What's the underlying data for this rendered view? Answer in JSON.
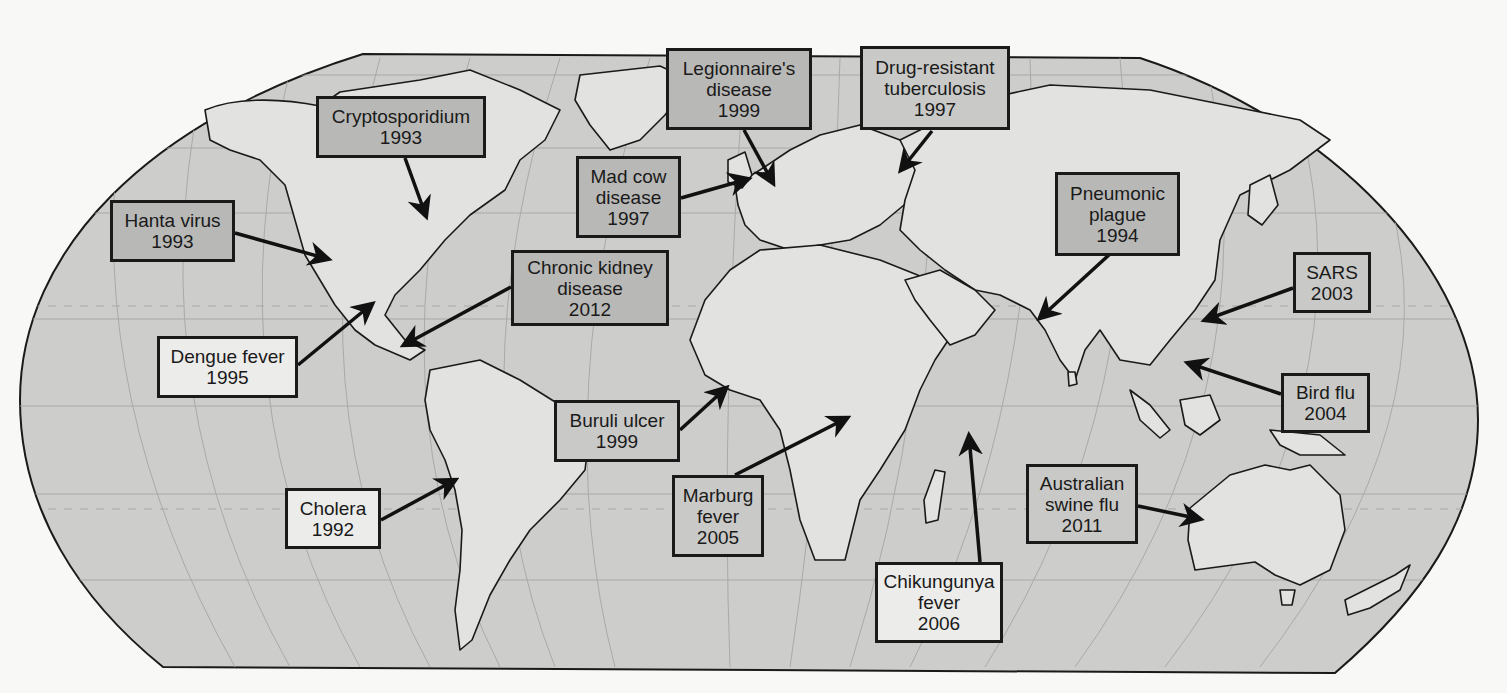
{
  "map": {
    "title": "Emerging and re-emerging infectious diseases",
    "projection": "Robinson-style world map with graticule",
    "colors": {
      "page_background": "#f8f8f7",
      "ocean": "#cdcdcb",
      "land": "#e2e2e0",
      "outline": "#1a1a1a",
      "graticule": "#a9a9a7",
      "label_dark": "#b8b8b6",
      "label_mid": "#c9c9c7",
      "label_light": "#ececea"
    }
  },
  "labels": [
    {
      "id": "cryptosporidium",
      "lines": [
        "Cryptosporidium",
        "1993"
      ],
      "tone": "dark",
      "box": [
        316,
        96,
        170,
        62
      ],
      "arrow": {
        "from": [
          405,
          158
        ],
        "to": [
          426,
          216
        ]
      }
    },
    {
      "id": "hanta-virus",
      "lines": [
        "Hanta virus",
        "1993"
      ],
      "tone": "dark",
      "box": [
        110,
        200,
        125,
        62
      ],
      "arrow": {
        "from": [
          235,
          233
        ],
        "to": [
          328,
          259
        ]
      }
    },
    {
      "id": "legionnaires",
      "lines": [
        "Legionnaire's",
        "disease",
        "1999"
      ],
      "tone": "dark",
      "box": [
        666,
        48,
        146,
        82
      ],
      "arrow": {
        "from": [
          744,
          130
        ],
        "to": [
          773,
          183
        ]
      }
    },
    {
      "id": "drug-resistant-tb",
      "lines": [
        "Drug-resistant",
        "tuberculosis",
        "1997"
      ],
      "tone": "mid",
      "box": [
        860,
        46,
        150,
        84
      ],
      "arrow": {
        "from": [
          932,
          131
        ],
        "to": [
          901,
          170
        ]
      }
    },
    {
      "id": "mad-cow",
      "lines": [
        "Mad cow",
        "disease",
        "1997"
      ],
      "tone": "dark",
      "box": [
        576,
        156,
        105,
        82
      ],
      "arrow": {
        "from": [
          681,
          198
        ],
        "to": [
          748,
          179
        ]
      }
    },
    {
      "id": "pneumonic-plague",
      "lines": [
        "Pneumonic",
        "plague",
        "1994"
      ],
      "tone": "dark",
      "box": [
        1055,
        172,
        125,
        84
      ],
      "arrow": {
        "from": [
          1110,
          254
        ],
        "to": [
          1040,
          318
        ]
      }
    },
    {
      "id": "sars",
      "lines": [
        "SARS",
        "2003"
      ],
      "tone": "mid",
      "box": [
        1293,
        252,
        78,
        61
      ],
      "arrow": {
        "from": [
          1293,
          288
        ],
        "to": [
          1205,
          320
        ]
      }
    },
    {
      "id": "chronic-kidney",
      "lines": [
        "Chronic kidney",
        "disease",
        "2012"
      ],
      "tone": "dark",
      "box": [
        511,
        250,
        158,
        76
      ],
      "arrow": {
        "from": [
          511,
          287
        ],
        "to": [
          404,
          345
        ]
      }
    },
    {
      "id": "dengue-fever",
      "lines": [
        "Dengue fever",
        "1995"
      ],
      "tone": "light",
      "box": [
        157,
        336,
        141,
        62
      ],
      "arrow": {
        "from": [
          298,
          365
        ],
        "to": [
          372,
          304
        ]
      }
    },
    {
      "id": "bird-flu",
      "lines": [
        "Bird flu",
        "2004"
      ],
      "tone": "mid",
      "box": [
        1281,
        373,
        89,
        60
      ],
      "arrow": {
        "from": [
          1281,
          394
        ],
        "to": [
          1188,
          363
        ]
      }
    },
    {
      "id": "buruli-ulcer",
      "lines": [
        "Buruli ulcer",
        "1999"
      ],
      "tone": "mid",
      "box": [
        554,
        400,
        126,
        62
      ],
      "arrow": {
        "from": [
          680,
          430
        ],
        "to": [
          726,
          388
        ]
      }
    },
    {
      "id": "cholera",
      "lines": [
        "Cholera",
        "1992"
      ],
      "tone": "light",
      "box": [
        285,
        488,
        96,
        61
      ],
      "arrow": {
        "from": [
          381,
          520
        ],
        "to": [
          455,
          480
        ]
      }
    },
    {
      "id": "marburg-fever",
      "lines": [
        "Marburg",
        "fever",
        "2005"
      ],
      "tone": "mid",
      "box": [
        672,
        475,
        92,
        82
      ],
      "arrow": {
        "from": [
          735,
          475
        ],
        "to": [
          847,
          418
        ]
      }
    },
    {
      "id": "australian-swine-flu",
      "lines": [
        "Australian",
        "swine flu",
        "2011"
      ],
      "tone": "mid",
      "box": [
        1026,
        464,
        112,
        80
      ],
      "arrow": {
        "from": [
          1138,
          506
        ],
        "to": [
          1200,
          519
        ]
      }
    },
    {
      "id": "chikungunya",
      "lines": [
        "Chikungunya",
        "fever",
        "2006"
      ],
      "tone": "light",
      "box": [
        875,
        562,
        128,
        81
      ],
      "arrow": {
        "from": [
          980,
          562
        ],
        "to": [
          969,
          436
        ]
      }
    }
  ]
}
